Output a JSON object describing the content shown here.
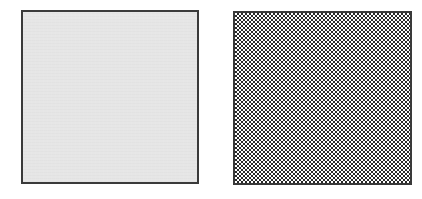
{
  "canvas": {
    "width": 422,
    "height": 199,
    "background": "#ffffff"
  },
  "panels": [
    {
      "id": "left",
      "pattern": "uniform-gray",
      "fill_color": "#e6e6e6",
      "border_color": "#3a3a3a"
    },
    {
      "id": "right",
      "pattern": "checkerboard",
      "check_colors": [
        "#2a2a2a",
        "#ffffff"
      ],
      "check_cell_px": 2,
      "border_color": "#3a3a3a"
    }
  ]
}
